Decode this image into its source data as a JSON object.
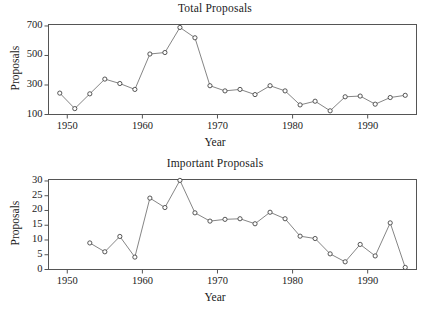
{
  "page": {
    "background": "#ffffff",
    "clipped_top_text": ""
  },
  "colors": {
    "axis": "#555555",
    "line": "#666666",
    "marker_fill": "#ffffff",
    "marker_stroke": "#444444",
    "text": "#1a1a1a"
  },
  "chart_data": [
    {
      "id": "total-proposals",
      "type": "line",
      "title": "Total Proposals",
      "xlabel": "Year",
      "ylabel": "Proposals",
      "grid": false,
      "legend": "none",
      "xlim": [
        1947.5,
        1996.5
      ],
      "ylim": [
        100,
        710
      ],
      "xticks": [
        1950,
        1960,
        1970,
        1980,
        1990
      ],
      "xticklabels": [
        "1950",
        "1960",
        "1970",
        "1980",
        "1990"
      ],
      "yticks": [
        100,
        300,
        500,
        700
      ],
      "yticklabels": [
        "100",
        "300",
        "500",
        "700"
      ],
      "x": [
        1949,
        1951,
        1953,
        1955,
        1957,
        1959,
        1961,
        1963,
        1965,
        1967,
        1969,
        1971,
        1973,
        1975,
        1977,
        1979,
        1981,
        1983,
        1985,
        1987,
        1989,
        1991,
        1993,
        1995
      ],
      "values": [
        245,
        140,
        240,
        340,
        310,
        270,
        510,
        520,
        690,
        620,
        295,
        260,
        270,
        235,
        295,
        260,
        165,
        190,
        125,
        220,
        225,
        170,
        215,
        230
      ]
    },
    {
      "id": "important-proposals",
      "type": "line",
      "title": "Important Proposals",
      "xlabel": "Year",
      "ylabel": "Proposals",
      "grid": false,
      "legend": "none",
      "xlim": [
        1947.5,
        1996.5
      ],
      "ylim": [
        0,
        30.5
      ],
      "xticks": [
        1950,
        1960,
        1970,
        1980,
        1990
      ],
      "xticklabels": [
        "1950",
        "1960",
        "1970",
        "1980",
        "1990"
      ],
      "yticks": [
        0,
        5,
        10,
        15,
        20,
        25,
        30
      ],
      "yticklabels": [
        "0",
        "5",
        "10",
        "15",
        "20",
        "25",
        "30"
      ],
      "x": [
        1953,
        1955,
        1957,
        1959,
        1961,
        1963,
        1965,
        1967,
        1969,
        1971,
        1973,
        1975,
        1977,
        1979,
        1981,
        1983,
        1985,
        1987,
        1989,
        1991,
        1993,
        1995
      ],
      "values": [
        9.0,
        6.0,
        11.2,
        4.2,
        24.2,
        21.0,
        30.2,
        19.2,
        16.4,
        17.0,
        17.2,
        15.5,
        19.4,
        17.2,
        11.3,
        10.5,
        5.3,
        2.6,
        8.5,
        4.6,
        15.8,
        0.7
      ]
    }
  ]
}
